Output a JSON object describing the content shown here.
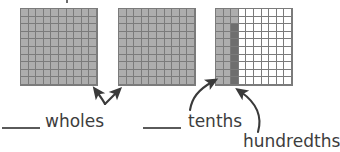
{
  "diagram": {
    "colors": {
      "grid_line": "#7b7b7b",
      "tenths_shade": "#adadad",
      "hundredths_shade": "#6e6e6e",
      "empty": "#ffffff",
      "text": "#3d3d3d",
      "arrow": "#3a3a3a"
    },
    "grids": [
      {
        "name": "grid-1-whole",
        "rows": 10,
        "cols": 10,
        "shaded_cells": 100,
        "description": "fully shaded hundred-square representing one whole",
        "pattern": [
          "LLLLLLLLLL",
          "LLLLLLLLLL",
          "LLLLLLLLLL",
          "LLLLLLLLLL",
          "LLLLLLLLLL",
          "LLLLLLLLLL",
          "LLLLLLLLLL",
          "LLLLLLLLLL",
          "LLLLLLLLLL",
          "LLLLLLLLLL"
        ]
      },
      {
        "name": "grid-2-whole",
        "rows": 10,
        "cols": 10,
        "shaded_cells": 100,
        "description": "fully shaded hundred-square representing one whole",
        "pattern": [
          "LLLLLLLLLL",
          "LLLLLLLLLL",
          "LLLLLLLLLL",
          "LLLLLLLLLL",
          "LLLLLLLLLL",
          "LLLLLLLLLL",
          "LLLLLLLLLL",
          "LLLLLLLLLL",
          "LLLLLLLLLL",
          "LLLLLLLLLL"
        ]
      },
      {
        "name": "grid-3-partial",
        "rows": 10,
        "cols": 10,
        "tenths_shaded": 2,
        "hundredths_shaded": 8,
        "description": "two full columns shaded light (tenths) plus eight cells of a third column shaded dark (hundredths)",
        "pattern": [
          "LLL.......",
          "LLL.......",
          "LLD.......",
          "LLD.......",
          "LLD.......",
          "LLD.......",
          "LLD.......",
          "LLD.......",
          "LLD.......",
          "LLD......."
        ]
      }
    ],
    "labels": [
      {
        "name": "wholes",
        "text": "wholes"
      },
      {
        "name": "tenths",
        "text": "tenths"
      },
      {
        "name": "hundredths",
        "text": "hundredths"
      }
    ],
    "blanks": [
      {
        "name": "blank-wholes",
        "text": ""
      },
      {
        "name": "blank-tenths",
        "text": ""
      }
    ],
    "arrows": [
      {
        "name": "arrow-wholes-left",
        "from": "wholes-label",
        "to": "grid-1-whole"
      },
      {
        "name": "arrow-wholes-right",
        "from": "wholes-label",
        "to": "grid-2-whole"
      },
      {
        "name": "arrow-tenths",
        "from": "tenths-label",
        "to": "grid-3-light-columns"
      },
      {
        "name": "arrow-hundredths",
        "from": "hundredths-label",
        "to": "grid-3-dark-column"
      }
    ]
  }
}
